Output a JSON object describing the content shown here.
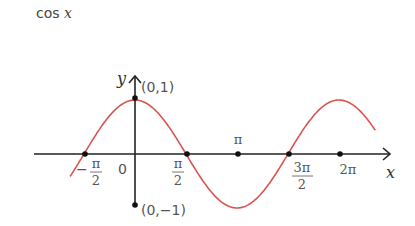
{
  "title": {
    "func": "cos",
    "var": "x"
  },
  "chart_data": {
    "type": "line",
    "title": "cos x",
    "xlabel": "x",
    "ylabel": "y",
    "function": "y = cos(x)",
    "x_range": [
      -2.0,
      7.4
    ],
    "ylim": [
      -1,
      1
    ],
    "grid": false,
    "legend": false,
    "series": [
      {
        "name": "cos x",
        "color": "#d9534f",
        "x": [
          -2.0,
          -1.5708,
          0,
          1.5708,
          3.1416,
          4.7124,
          6.2832,
          7.4
        ],
        "values": [
          -0.416,
          0,
          1,
          0,
          -1,
          0,
          1,
          0.439
        ]
      }
    ],
    "x_ticks": [
      "-π/2",
      "0",
      "π/2",
      "π",
      "3π/2",
      "2π"
    ],
    "annotations": [
      "(0,1)",
      "(0,-1)"
    ]
  },
  "labels": {
    "y_axis": "y",
    "x_axis": "x",
    "origin": "0",
    "point_top": "(0,1)",
    "point_bottom": "(0,−1)",
    "neg_half_pi_num": "π",
    "neg_half_pi_den": "2",
    "neg_sign": "−",
    "half_pi_num": "π",
    "half_pi_den": "2",
    "pi": "π",
    "three_half_pi_num": "3π",
    "three_half_pi_den": "2",
    "two_pi": "2π"
  },
  "colors": {
    "curve": "#d9534f",
    "axis": "#222222"
  }
}
